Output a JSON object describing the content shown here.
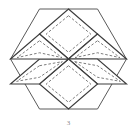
{
  "figure": {
    "caption": "3",
    "shape_type": "geometric-diagram",
    "colors": {
      "background": "#ffffff",
      "outer_hexagon_stroke": "#5a5a5a",
      "rhombus_stroke": "#3c3c3c",
      "dashed_inset_stroke": "#6e6e6e",
      "caption_color": "#8a8a8a"
    },
    "geometry": {
      "center": {
        "x": 68.5,
        "y": 59
      },
      "outer_hexagon": {
        "name": "outer-hexagon",
        "sides": 6,
        "orientation": "pointy-side-vertical",
        "circumradius": 58,
        "vertices": [
          {
            "x": 39.5,
            "y": 9.0
          },
          {
            "x": 97.5,
            "y": 9.0
          },
          {
            "x": 126.5,
            "y": 59.0
          },
          {
            "x": 97.5,
            "y": 109.0
          },
          {
            "x": 39.5,
            "y": 109.0
          },
          {
            "x": 10.5,
            "y": 59.0
          }
        ]
      },
      "inner_hexagon": {
        "name": "inner-hexagon-vertices",
        "circumradius": 29,
        "vertices": [
          {
            "x": 68.5,
            "y": 9.0
          },
          {
            "x": 111.6,
            "y": 34.0
          },
          {
            "x": 111.6,
            "y": 84.0
          },
          {
            "x": 68.5,
            "y": 109.0
          },
          {
            "x": 25.4,
            "y": 84.0
          },
          {
            "x": 25.4,
            "y": 34.0
          }
        ]
      },
      "rhombi_count": 6,
      "dashed_inset_offset": 3.2,
      "rhombi": [
        {
          "id": "rhombus-top",
          "label": "top",
          "points": [
            {
              "x": 68.5,
              "y": 9.0
            },
            {
              "x": 97.5,
              "y": 34.0
            },
            {
              "x": 68.5,
              "y": 59.0
            },
            {
              "x": 39.5,
              "y": 34.0
            }
          ]
        },
        {
          "id": "rhombus-upper-right",
          "label": "upper-right",
          "points": [
            {
              "x": 97.5,
              "y": 34.0
            },
            {
              "x": 126.5,
              "y": 59.0
            },
            {
              "x": 97.5,
              "y": 59.0
            },
            {
              "x": 68.5,
              "y": 59.0
            }
          ]
        },
        {
          "id": "rhombus-lower-right",
          "label": "lower-right",
          "points": [
            {
              "x": 68.5,
              "y": 59.0
            },
            {
              "x": 97.5,
              "y": 59.0
            },
            {
              "x": 126.5,
              "y": 84.0
            },
            {
              "x": 97.5,
              "y": 84.0
            }
          ]
        },
        {
          "id": "rhombus-bottom",
          "label": "bottom",
          "points": [
            {
              "x": 68.5,
              "y": 59.0
            },
            {
              "x": 97.5,
              "y": 84.0
            },
            {
              "x": 68.5,
              "y": 109.0
            },
            {
              "x": 39.5,
              "y": 84.0
            }
          ]
        },
        {
          "id": "rhombus-lower-left",
          "label": "lower-left",
          "points": [
            {
              "x": 39.5,
              "y": 59.0
            },
            {
              "x": 68.5,
              "y": 59.0
            },
            {
              "x": 39.5,
              "y": 84.0
            },
            {
              "x": 10.5,
              "y": 84.0
            }
          ]
        },
        {
          "id": "rhombus-upper-left",
          "label": "upper-left",
          "points": [
            {
              "x": 39.5,
              "y": 34.0
            },
            {
              "x": 68.5,
              "y": 59.0
            },
            {
              "x": 39.5,
              "y": 59.0
            },
            {
              "x": 10.5,
              "y": 59.0
            }
          ]
        }
      ]
    }
  }
}
